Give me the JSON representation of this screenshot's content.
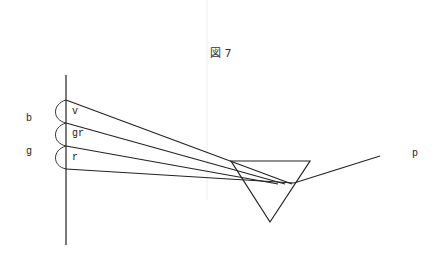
{
  "figure": {
    "caption": "図 7",
    "labels": {
      "b": "b",
      "g": "g",
      "v": "v",
      "gr": "gr",
      "r": "r",
      "p": "p"
    },
    "stroke_color": "#222222",
    "background": "#ffffff"
  }
}
